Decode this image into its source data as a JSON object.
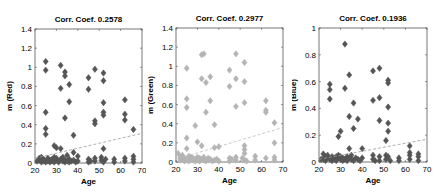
{
  "chart_data": [
    {
      "type": "scatter",
      "title": "Corr. Coef. 0.2578",
      "xlabel": "Age",
      "ylabel": "m (Red)",
      "xlim": [
        20,
        70
      ],
      "ylim": [
        0,
        1.4
      ],
      "xticks": [
        20,
        30,
        40,
        50,
        60,
        70
      ],
      "yticks": [
        0,
        0.2,
        0.4,
        0.6,
        0.8,
        1,
        1.2,
        1.4
      ],
      "ytick_labels": [
        "0",
        "0.2",
        "0.4",
        "0.6",
        "0.8",
        "1",
        "1.2",
        "1.4"
      ],
      "grid": false,
      "marker_color": "#555555",
      "trend_line": {
        "x": [
          20,
          70
        ],
        "y": [
          0.05,
          0.31
        ],
        "style": "dashed",
        "color": "#999999"
      },
      "points": [
        [
          25,
          1.06
        ],
        [
          25,
          0.97
        ],
        [
          25,
          0.53
        ],
        [
          25,
          0.36
        ],
        [
          25,
          0.3
        ],
        [
          32,
          1.02
        ],
        [
          34,
          0.95
        ],
        [
          34,
          0.91
        ],
        [
          32,
          0.78
        ],
        [
          36,
          0.82
        ],
        [
          36,
          0.64
        ],
        [
          34,
          0.47
        ],
        [
          38,
          0.29
        ],
        [
          45,
          0.89
        ],
        [
          45,
          0.77
        ],
        [
          48,
          0.98
        ],
        [
          48,
          0.44
        ],
        [
          48,
          0.41
        ],
        [
          52,
          0.94
        ],
        [
          52,
          0.86
        ],
        [
          52,
          0.63
        ],
        [
          52,
          0.53
        ],
        [
          52,
          0.5
        ],
        [
          52,
          0.15
        ],
        [
          62,
          0.66
        ],
        [
          62,
          0.51
        ],
        [
          62,
          0.45
        ],
        [
          66,
          0.35
        ],
        [
          29,
          0.18
        ],
        [
          30,
          0.16
        ],
        [
          32,
          0.15
        ],
        [
          35,
          0.08
        ],
        [
          38,
          0.11
        ],
        [
          40,
          0.07
        ],
        [
          21,
          0.02
        ],
        [
          22,
          0.05
        ],
        [
          22,
          0.03
        ],
        [
          23,
          0.06
        ],
        [
          23,
          0.01
        ],
        [
          24,
          0.04
        ],
        [
          24,
          0.02
        ],
        [
          25,
          0.01
        ],
        [
          26,
          0.05
        ],
        [
          26,
          0.02
        ],
        [
          27,
          0.03
        ],
        [
          27,
          0.01
        ],
        [
          28,
          0.04
        ],
        [
          28,
          0.02
        ],
        [
          29,
          0.06
        ],
        [
          29,
          0.01
        ],
        [
          30,
          0.03
        ],
        [
          30,
          0.05
        ],
        [
          31,
          0.02
        ],
        [
          31,
          0.01
        ],
        [
          32,
          0.04
        ],
        [
          33,
          0.02
        ],
        [
          33,
          0.06
        ],
        [
          34,
          0.01
        ],
        [
          34,
          0.03
        ],
        [
          35,
          0.02
        ],
        [
          36,
          0.04
        ],
        [
          36,
          0.01
        ],
        [
          37,
          0.02
        ],
        [
          38,
          0.03
        ],
        [
          39,
          0.01
        ],
        [
          40,
          0.02
        ],
        [
          45,
          0.04
        ],
        [
          45,
          0.01
        ],
        [
          46,
          0.02
        ],
        [
          48,
          0.05
        ],
        [
          48,
          0.02
        ],
        [
          51,
          0.06
        ],
        [
          51,
          0.03
        ],
        [
          52,
          0.01
        ],
        [
          53,
          0.04
        ],
        [
          57,
          0.04
        ],
        [
          57,
          0.01
        ],
        [
          62,
          0.05
        ],
        [
          62,
          0.02
        ],
        [
          66,
          0.07
        ],
        [
          66,
          0.04
        ],
        [
          66,
          0.01
        ]
      ]
    },
    {
      "type": "scatter",
      "title": "Corr. Coef. 0.2977",
      "xlabel": "Age",
      "ylabel": "m (Green)",
      "xlim": [
        20,
        70
      ],
      "ylim": [
        0,
        1.4
      ],
      "xticks": [
        20,
        30,
        40,
        50,
        60,
        70
      ],
      "yticks": [
        0,
        0.2,
        0.4,
        0.6,
        0.8,
        1,
        1.2,
        1.4
      ],
      "ytick_labels": [
        "0",
        "0.2",
        "0.4",
        "0.6",
        "0.8",
        "1",
        "1.2",
        "1.4"
      ],
      "grid": false,
      "marker_color": "#b4b4b4",
      "trend_line": {
        "x": [
          20,
          70
        ],
        "y": [
          0.03,
          0.36
        ],
        "style": "dashed",
        "color": "#bbbbbb"
      },
      "points": [
        [
          25,
          0.98
        ],
        [
          25,
          0.66
        ],
        [
          25,
          0.57
        ],
        [
          25,
          0.25
        ],
        [
          25,
          0.14
        ],
        [
          32,
          1.12
        ],
        [
          33,
          1.13
        ],
        [
          32,
          0.87
        ],
        [
          34,
          0.83
        ],
        [
          36,
          0.89
        ],
        [
          36,
          0.64
        ],
        [
          34,
          0.52
        ],
        [
          29,
          0.38
        ],
        [
          38,
          0.39
        ],
        [
          45,
          0.96
        ],
        [
          45,
          0.79
        ],
        [
          48,
          1.13
        ],
        [
          48,
          0.87
        ],
        [
          48,
          0.58
        ],
        [
          52,
          1.04
        ],
        [
          52,
          0.84
        ],
        [
          52,
          0.62
        ],
        [
          52,
          0.17
        ],
        [
          52,
          0.13
        ],
        [
          52,
          0.09
        ],
        [
          62,
          0.64
        ],
        [
          62,
          0.54
        ],
        [
          62,
          0.52
        ],
        [
          66,
          0.41
        ],
        [
          66,
          0.2
        ],
        [
          30,
          0.21
        ],
        [
          32,
          0.17
        ],
        [
          38,
          0.15
        ],
        [
          40,
          0.16
        ],
        [
          21,
          0.09
        ],
        [
          22,
          0.05
        ],
        [
          22,
          0.02
        ],
        [
          23,
          0.07
        ],
        [
          23,
          0.03
        ],
        [
          24,
          0.01
        ],
        [
          24,
          0.04
        ],
        [
          25,
          0.02
        ],
        [
          26,
          0.06
        ],
        [
          26,
          0.01
        ],
        [
          27,
          0.03
        ],
        [
          27,
          0.05
        ],
        [
          28,
          0.02
        ],
        [
          28,
          0.04
        ],
        [
          29,
          0.01
        ],
        [
          29,
          0.03
        ],
        [
          30,
          0.05
        ],
        [
          30,
          0.02
        ],
        [
          31,
          0.04
        ],
        [
          31,
          0.01
        ],
        [
          32,
          0.03
        ],
        [
          33,
          0.05
        ],
        [
          33,
          0.02
        ],
        [
          34,
          0.01
        ],
        [
          35,
          0.04
        ],
        [
          35,
          0.02
        ],
        [
          36,
          0.03
        ],
        [
          37,
          0.01
        ],
        [
          38,
          0.02
        ],
        [
          39,
          0.03
        ],
        [
          40,
          0.01
        ],
        [
          45,
          0.04
        ],
        [
          45,
          0.01
        ],
        [
          46,
          0.03
        ],
        [
          48,
          0.02
        ],
        [
          48,
          0.05
        ],
        [
          51,
          0.04
        ],
        [
          52,
          0.02
        ],
        [
          53,
          0.01
        ],
        [
          57,
          0.06
        ],
        [
          57,
          0.02
        ],
        [
          62,
          0.04
        ],
        [
          66,
          0.05
        ],
        [
          66,
          0.02
        ]
      ]
    },
    {
      "type": "scatter",
      "title": "Corr. Coef. 0.1936",
      "xlabel": "Age",
      "ylabel": "m (Blue)",
      "xlim": [
        20,
        70
      ],
      "ylim": [
        0,
        1
      ],
      "xticks": [
        20,
        30,
        40,
        50,
        60,
        70
      ],
      "yticks": [
        0,
        0.2,
        0.4,
        0.6,
        0.8,
        1
      ],
      "ytick_labels": [
        "0",
        "0.2",
        "0.4",
        "0.6",
        "0.8",
        "1"
      ],
      "grid": false,
      "marker_color": "#555555",
      "trend_line": {
        "x": [
          20,
          70
        ],
        "y": [
          0.02,
          0.17
        ],
        "style": "dashed",
        "color": "#999999"
      },
      "points": [
        [
          32,
          0.88
        ],
        [
          34,
          0.65
        ],
        [
          25,
          0.58
        ],
        [
          25,
          0.54
        ],
        [
          25,
          0.47
        ],
        [
          32,
          0.55
        ],
        [
          36,
          0.44
        ],
        [
          34,
          0.34
        ],
        [
          36,
          0.25
        ],
        [
          38,
          0.32
        ],
        [
          30,
          0.23
        ],
        [
          29,
          0.19
        ],
        [
          45,
          0.68
        ],
        [
          48,
          0.7
        ],
        [
          45,
          0.46
        ],
        [
          48,
          0.48
        ],
        [
          48,
          0.31
        ],
        [
          52,
          0.61
        ],
        [
          52,
          0.59
        ],
        [
          52,
          0.41
        ],
        [
          52,
          0.29
        ],
        [
          52,
          0.23
        ],
        [
          51,
          0.16
        ],
        [
          62,
          0.12
        ],
        [
          62,
          0.07
        ],
        [
          62,
          0.05
        ],
        [
          66,
          0.04
        ],
        [
          66,
          0.01
        ],
        [
          34,
          0.1
        ],
        [
          40,
          0.1
        ],
        [
          21,
          0.02
        ],
        [
          22,
          0.06
        ],
        [
          22,
          0.02
        ],
        [
          23,
          0.04
        ],
        [
          23,
          0.01
        ],
        [
          24,
          0.03
        ],
        [
          24,
          0.05
        ],
        [
          25,
          0.02
        ],
        [
          26,
          0.04
        ],
        [
          26,
          0.01
        ],
        [
          27,
          0.03
        ],
        [
          27,
          0.02
        ],
        [
          28,
          0.04
        ],
        [
          28,
          0.01
        ],
        [
          29,
          0.03
        ],
        [
          29,
          0.05
        ],
        [
          30,
          0.02
        ],
        [
          30,
          0.04
        ],
        [
          31,
          0.01
        ],
        [
          31,
          0.03
        ],
        [
          32,
          0.02
        ],
        [
          33,
          0.04
        ],
        [
          33,
          0.01
        ],
        [
          34,
          0.03
        ],
        [
          35,
          0.02
        ],
        [
          35,
          0.05
        ],
        [
          36,
          0.01
        ],
        [
          37,
          0.03
        ],
        [
          38,
          0.02
        ],
        [
          39,
          0.01
        ],
        [
          40,
          0.03
        ],
        [
          45,
          0.05
        ],
        [
          45,
          0.02
        ],
        [
          46,
          0.01
        ],
        [
          48,
          0.04
        ],
        [
          48,
          0.01
        ],
        [
          51,
          0.05
        ],
        [
          51,
          0.02
        ],
        [
          52,
          0.04
        ],
        [
          53,
          0.01
        ],
        [
          57,
          0.03
        ],
        [
          57,
          0.01
        ],
        [
          62,
          0.02
        ],
        [
          66,
          0.06
        ]
      ]
    }
  ],
  "panels": [
    {
      "title": "Corr. Coef. 0.2578",
      "xlabel": "Age",
      "ylabel": "m (Red)"
    },
    {
      "title": "Corr. Coef. 0.2977",
      "xlabel": "Age",
      "ylabel": "m (Green)"
    },
    {
      "title": "Corr. Coef. 0.1936",
      "xlabel": "Age",
      "ylabel": "m (Blue)"
    }
  ]
}
